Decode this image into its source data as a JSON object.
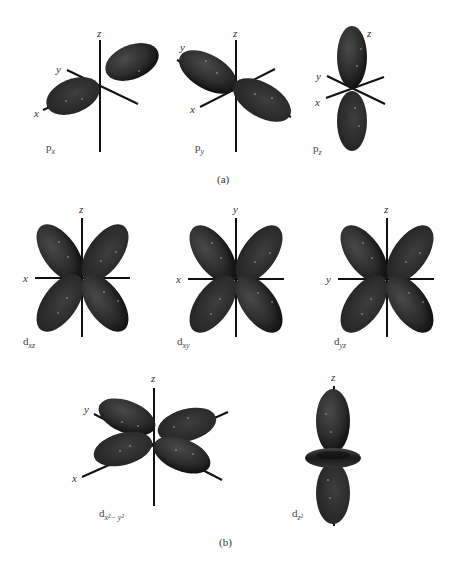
{
  "figure": {
    "panel_a": {
      "caption": "(a)",
      "orbitals": [
        {
          "name": "p",
          "subscript": "x",
          "axes": [
            "z",
            "y",
            "x"
          ]
        },
        {
          "name": "p",
          "subscript": "y",
          "axes": [
            "z",
            "y",
            "x"
          ]
        },
        {
          "name": "p",
          "subscript": "z",
          "axes": [
            "z",
            "y",
            "x"
          ]
        }
      ]
    },
    "panel_b": {
      "caption": "(b)",
      "orbitals": [
        {
          "name": "d",
          "subscript": "xz",
          "axes": [
            "z",
            "x"
          ]
        },
        {
          "name": "d",
          "subscript": "xy",
          "axes": [
            "y",
            "x"
          ]
        },
        {
          "name": "d",
          "subscript": "yz",
          "axes": [
            "z",
            "y"
          ]
        },
        {
          "name": "d",
          "subscript": "x²− y²",
          "axes": [
            "z",
            "y",
            "x"
          ]
        },
        {
          "name": "d",
          "subscript": "z²",
          "axes": [
            "z"
          ]
        }
      ]
    },
    "colors": {
      "lobe_dark": "#1a1a1a",
      "lobe_mid": "#3a3a3a",
      "axis": "#111111"
    }
  }
}
